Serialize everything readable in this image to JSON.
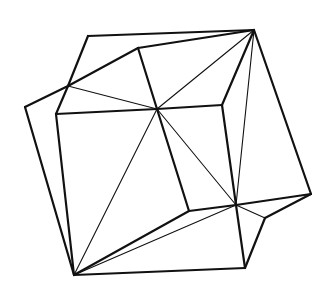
{
  "figure": {
    "stroke_color": "#111111",
    "background": "#ffffff",
    "vertices": {
      "A": [
        88,
        36
      ],
      "B": [
        254,
        30
      ],
      "C": [
        138,
        48
      ],
      "D": [
        68,
        86
      ],
      "E": [
        25,
        107
      ],
      "F": [
        56,
        114
      ],
      "G": [
        157,
        109
      ],
      "H": [
        222,
        105
      ],
      "I": [
        311,
        194
      ],
      "J": [
        236,
        205
      ],
      "K": [
        189,
        211
      ],
      "L": [
        265,
        218
      ],
      "M": [
        245,
        268
      ],
      "N": [
        74,
        275
      ]
    },
    "thick_edges": [
      [
        "A",
        "B"
      ],
      [
        "A",
        "D"
      ],
      [
        "D",
        "F"
      ],
      [
        "C",
        "B"
      ],
      [
        "D",
        "C"
      ],
      [
        "C",
        "G"
      ],
      [
        "E",
        "D"
      ],
      [
        "E",
        "N"
      ],
      [
        "F",
        "G"
      ],
      [
        "F",
        "N"
      ],
      [
        "G",
        "K"
      ],
      [
        "K",
        "J"
      ],
      [
        "H",
        "G"
      ],
      [
        "H",
        "J"
      ],
      [
        "B",
        "H"
      ],
      [
        "B",
        "I"
      ],
      [
        "J",
        "I"
      ],
      [
        "I",
        "L"
      ],
      [
        "L",
        "M"
      ],
      [
        "J",
        "M"
      ],
      [
        "M",
        "N"
      ],
      [
        "N",
        "K"
      ]
    ],
    "thin_edges": [
      [
        "D",
        "G"
      ],
      [
        "G",
        "B"
      ],
      [
        "G",
        "N"
      ],
      [
        "G",
        "J"
      ],
      [
        "B",
        "J"
      ],
      [
        "N",
        "J"
      ],
      [
        "J",
        "L"
      ]
    ]
  }
}
